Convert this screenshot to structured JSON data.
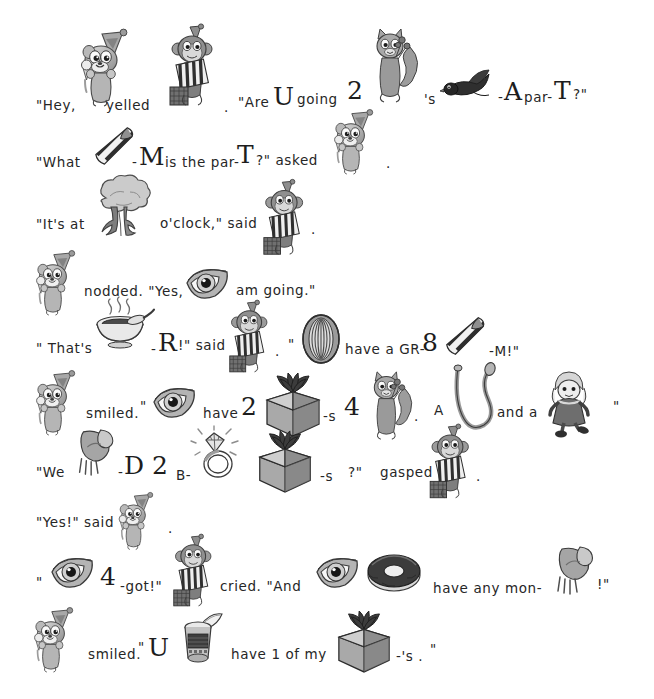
{
  "document": {
    "type": "rebus-story",
    "title": "Party Rebus Story",
    "background_color": "#ffffff",
    "text_color": "#262626",
    "page_width": 654,
    "page_height": 699
  },
  "lines": [
    {
      "id": "line-1",
      "tokens": [
        {
          "kind": "text",
          "value": "\"Hey,",
          "x": 36,
          "y": 99
        },
        {
          "kind": "picture",
          "name": "chipmunk-party-hat-icecream",
          "x": 76,
          "y": 30,
          "w": 62,
          "h": 78
        },
        {
          "kind": "text",
          "value": "yelled",
          "x": 106,
          "y": 99
        },
        {
          "kind": "picture",
          "name": "monkey-with-striped-gift",
          "x": 168,
          "y": 25,
          "w": 52,
          "h": 88
        },
        {
          "kind": "text",
          "value": ".",
          "x": 224,
          "y": 101
        },
        {
          "kind": "text",
          "value": "\"Are",
          "x": 238,
          "y": 96
        },
        {
          "kind": "big",
          "value": "U",
          "x": 273,
          "y": 82
        },
        {
          "kind": "text",
          "value": "going",
          "x": 297,
          "y": 93
        },
        {
          "kind": "big",
          "value": "2",
          "x": 347,
          "y": 76
        },
        {
          "kind": "picture",
          "name": "squirrel-with-flowers",
          "x": 368,
          "y": 27,
          "w": 52,
          "h": 78
        },
        {
          "kind": "text",
          "value": "'s",
          "x": 424,
          "y": 93
        },
        {
          "kind": "picture",
          "name": "blackbird-flying",
          "x": 443,
          "y": 68,
          "w": 50,
          "h": 34
        },
        {
          "kind": "text",
          "value": "-",
          "x": 498,
          "y": 91
        },
        {
          "kind": "big",
          "value": "A",
          "x": 504,
          "y": 77
        },
        {
          "kind": "text",
          "value": "par-",
          "x": 524,
          "y": 91
        },
        {
          "kind": "big",
          "value": "T",
          "x": 554,
          "y": 76
        },
        {
          "kind": "text",
          "value": "?\"",
          "x": 573,
          "y": 88
        }
      ]
    },
    {
      "id": "line-2",
      "tokens": [
        {
          "kind": "text",
          "value": "\"What",
          "x": 36,
          "y": 156
        },
        {
          "kind": "picture",
          "name": "striped-necktie",
          "x": 88,
          "y": 126,
          "w": 52,
          "h": 40
        },
        {
          "kind": "text",
          "value": "-",
          "x": 132,
          "y": 156
        },
        {
          "kind": "big",
          "value": "M",
          "x": 139,
          "y": 142
        },
        {
          "kind": "text",
          "value": "is the par-",
          "x": 165,
          "y": 156
        },
        {
          "kind": "big",
          "value": "T",
          "x": 237,
          "y": 140
        },
        {
          "kind": "text",
          "value": "?\" asked",
          "x": 256,
          "y": 154
        },
        {
          "kind": "picture",
          "name": "chipmunk-party-hat-icecream",
          "x": 330,
          "y": 105,
          "w": 52,
          "h": 76
        },
        {
          "kind": "text",
          "value": ".",
          "x": 386,
          "y": 157
        }
      ]
    },
    {
      "id": "line-3",
      "tokens": [
        {
          "kind": "text",
          "value": "\"It's at",
          "x": 36,
          "y": 218
        },
        {
          "kind": "picture",
          "name": "tree",
          "x": 86,
          "y": 176,
          "w": 72,
          "h": 62
        },
        {
          "kind": "text",
          "value": "o'clock,\" said",
          "x": 160,
          "y": 217
        },
        {
          "kind": "picture",
          "name": "monkey-with-striped-gift",
          "x": 262,
          "y": 180,
          "w": 48,
          "h": 82
        },
        {
          "kind": "text",
          "value": ".",
          "x": 311,
          "y": 223
        }
      ]
    },
    {
      "id": "line-4",
      "tokens": [
        {
          "kind": "picture",
          "name": "chipmunk-party-hat-icecream",
          "x": 32,
          "y": 245,
          "w": 52,
          "h": 78
        },
        {
          "kind": "text",
          "value": "nodded. \"Yes,",
          "x": 84,
          "y": 285
        },
        {
          "kind": "picture",
          "name": "eye",
          "x": 184,
          "y": 262,
          "w": 46,
          "h": 42
        },
        {
          "kind": "text",
          "value": "am going.\"",
          "x": 236,
          "y": 284
        }
      ]
    },
    {
      "id": "line-5",
      "tokens": [
        {
          "kind": "text",
          "value": "\" That's",
          "x": 36,
          "y": 342
        },
        {
          "kind": "picture",
          "name": "steaming-soup-bowl",
          "x": 92,
          "y": 300,
          "w": 62,
          "h": 50
        },
        {
          "kind": "text",
          "value": "-",
          "x": 151,
          "y": 343
        },
        {
          "kind": "big",
          "value": "R",
          "x": 158,
          "y": 328
        },
        {
          "kind": "text",
          "value": "!\" said",
          "x": 178,
          "y": 339
        },
        {
          "kind": "picture",
          "name": "monkey-with-striped-gift",
          "x": 228,
          "y": 300,
          "w": 46,
          "h": 80
        },
        {
          "kind": "text",
          "value": ".",
          "x": 275,
          "y": 345
        },
        {
          "kind": "text",
          "value": "\"",
          "x": 288,
          "y": 338
        },
        {
          "kind": "picture",
          "name": "tire",
          "x": 300,
          "y": 314,
          "w": 42,
          "h": 50
        },
        {
          "kind": "text",
          "value": "have a GR-",
          "x": 345,
          "y": 343
        },
        {
          "kind": "big",
          "value": "8",
          "x": 422,
          "y": 328
        },
        {
          "kind": "picture",
          "name": "striped-necktie",
          "x": 440,
          "y": 315,
          "w": 50,
          "h": 42
        },
        {
          "kind": "text",
          "value": "-M!\"",
          "x": 489,
          "y": 345
        }
      ]
    },
    {
      "id": "line-6",
      "tokens": [
        {
          "kind": "picture",
          "name": "chipmunk-party-hat-icecream",
          "x": 32,
          "y": 365,
          "w": 52,
          "h": 78
        },
        {
          "kind": "text",
          "value": "smiled.",
          "x": 86,
          "y": 407
        },
        {
          "kind": "text",
          "value": "\"",
          "x": 140,
          "y": 400
        },
        {
          "kind": "picture",
          "name": "eye",
          "x": 152,
          "y": 381,
          "w": 44,
          "h": 42
        },
        {
          "kind": "text",
          "value": "have",
          "x": 203,
          "y": 407
        },
        {
          "kind": "big",
          "value": "2",
          "x": 241,
          "y": 392
        },
        {
          "kind": "picture",
          "name": "gift-box-bow",
          "x": 263,
          "y": 370,
          "w": 60,
          "h": 68
        },
        {
          "kind": "text",
          "value": "-s",
          "x": 323,
          "y": 410
        },
        {
          "kind": "big",
          "value": "4",
          "x": 344,
          "y": 392
        },
        {
          "kind": "picture",
          "name": "squirrel-with-flowers",
          "x": 366,
          "y": 370,
          "w": 48,
          "h": 72
        },
        {
          "kind": "text",
          "value": ".",
          "x": 414,
          "y": 410
        },
        {
          "kind": "text",
          "value": "A",
          "x": 434,
          "y": 404
        },
        {
          "kind": "picture",
          "name": "rope",
          "x": 452,
          "y": 365,
          "w": 44,
          "h": 70
        },
        {
          "kind": "text",
          "value": "and a",
          "x": 497,
          "y": 406
        },
        {
          "kind": "picture",
          "name": "doll",
          "x": 545,
          "y": 370,
          "w": 48,
          "h": 68
        },
        {
          "kind": "text",
          "value": "\"",
          "x": 613,
          "y": 400
        }
      ]
    },
    {
      "id": "line-7",
      "tokens": [
        {
          "kind": "text",
          "value": "\"We",
          "x": 36,
          "y": 466
        },
        {
          "kind": "picture",
          "name": "knee-bent-leg",
          "x": 73,
          "y": 428,
          "w": 44,
          "h": 50
        },
        {
          "kind": "text",
          "value": "-",
          "x": 118,
          "y": 466
        },
        {
          "kind": "big",
          "value": "D",
          "x": 124,
          "y": 451
        },
        {
          "kind": "big",
          "value": "2",
          "x": 152,
          "y": 451
        },
        {
          "kind": "text",
          "value": "B-",
          "x": 176,
          "y": 469
        },
        {
          "kind": "picture",
          "name": "diamond-ring",
          "x": 192,
          "y": 428,
          "w": 50,
          "h": 52
        },
        {
          "kind": "picture",
          "name": "gift-box-bow",
          "x": 255,
          "y": 428,
          "w": 60,
          "h": 66
        },
        {
          "kind": "text",
          "value": "-s",
          "x": 320,
          "y": 470
        },
        {
          "kind": "text",
          "value": "?\"",
          "x": 348,
          "y": 466
        },
        {
          "kind": "text",
          "value": "gasped",
          "x": 380,
          "y": 466
        },
        {
          "kind": "picture",
          "name": "monkey-with-striped-gift",
          "x": 428,
          "y": 425,
          "w": 48,
          "h": 80
        },
        {
          "kind": "text",
          "value": ".",
          "x": 476,
          "y": 470
        }
      ]
    },
    {
      "id": "line-8",
      "tokens": [
        {
          "kind": "text",
          "value": "\"Yes!\" said",
          "x": 36,
          "y": 516
        },
        {
          "kind": "picture",
          "name": "chipmunk-party-hat-icecream",
          "x": 115,
          "y": 487,
          "w": 46,
          "h": 70
        },
        {
          "kind": "text",
          "value": ".",
          "x": 168,
          "y": 522
        }
      ]
    },
    {
      "id": "line-9",
      "tokens": [
        {
          "kind": "text",
          "value": "\"",
          "x": 36,
          "y": 576
        },
        {
          "kind": "picture",
          "name": "eye",
          "x": 50,
          "y": 551,
          "w": 44,
          "h": 42
        },
        {
          "kind": "big",
          "value": "4",
          "x": 100,
          "y": 562
        },
        {
          "kind": "text",
          "value": "-got!\"",
          "x": 120,
          "y": 580
        },
        {
          "kind": "picture",
          "name": "monkey-with-striped-gift",
          "x": 172,
          "y": 535,
          "w": 46,
          "h": 78
        },
        {
          "kind": "text",
          "value": "cried. \"And",
          "x": 220,
          "y": 580
        },
        {
          "kind": "picture",
          "name": "eye",
          "x": 315,
          "y": 551,
          "w": 44,
          "h": 42
        },
        {
          "kind": "picture",
          "name": "donut",
          "x": 366,
          "y": 551,
          "w": 56,
          "h": 42
        },
        {
          "kind": "text",
          "value": "have any mon-",
          "x": 433,
          "y": 582
        },
        {
          "kind": "picture",
          "name": "knee-bent-leg",
          "x": 552,
          "y": 545,
          "w": 44,
          "h": 52
        },
        {
          "kind": "text",
          "value": "!\"",
          "x": 597,
          "y": 578
        }
      ]
    },
    {
      "id": "line-10",
      "tokens": [
        {
          "kind": "picture",
          "name": "chipmunk-party-hat-icecream",
          "x": 30,
          "y": 603,
          "w": 52,
          "h": 76
        },
        {
          "kind": "text",
          "value": "smiled.",
          "x": 88,
          "y": 648
        },
        {
          "kind": "text",
          "value": "\"",
          "x": 138,
          "y": 641
        },
        {
          "kind": "big",
          "value": "U",
          "x": 148,
          "y": 633
        },
        {
          "kind": "picture",
          "name": "tin-can-open",
          "x": 178,
          "y": 610,
          "w": 48,
          "h": 56
        },
        {
          "kind": "text",
          "value": "have 1 of my",
          "x": 231,
          "y": 648
        },
        {
          "kind": "picture",
          "name": "gift-box-bow",
          "x": 335,
          "y": 608,
          "w": 58,
          "h": 66
        },
        {
          "kind": "text",
          "value": "-'s .",
          "x": 396,
          "y": 650
        },
        {
          "kind": "text",
          "value": "\"",
          "x": 430,
          "y": 643
        }
      ]
    }
  ],
  "picture_legend": {
    "chipmunk-party-hat-icecream": "chipmunk wearing a party hat holding an ice cream cone",
    "monkey-with-striped-gift": "monkey wearing a party hat carrying a striped wrapped present",
    "squirrel-with-flowers": "squirrel standing holding flowers",
    "blackbird-flying": "black bird in flight",
    "striped-necktie": "diagonally striped necktie",
    "tree": "leafy tree",
    "eye": "single human eye",
    "steaming-soup-bowl": "bowl of soup with spoon and rising steam",
    "tire": "rubber tire / wheel",
    "gift-box-bow": "wrapped gift box with a large bow",
    "rope": "looped length of rope",
    "doll": "rag doll girl",
    "knee-bent-leg": "bent leg showing a knee",
    "diamond-ring": "sparkling diamond ring",
    "donut": "glazed doughnut",
    "tin-can-open": "opened tin can with peeled lid"
  }
}
